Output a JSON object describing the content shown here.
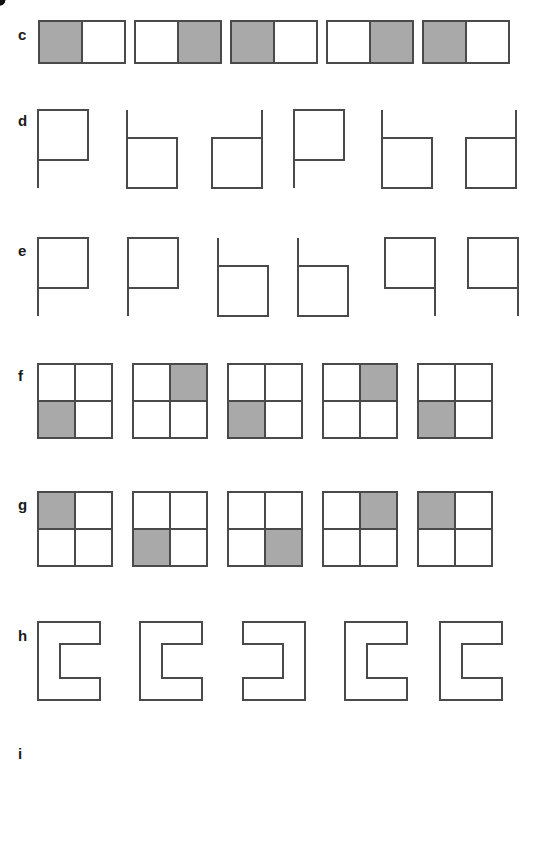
{
  "figure": {
    "type": "line-drawing-stimulus-sheet",
    "background_color": "#ffffff",
    "stroke_color": "#4a4a4a",
    "fill_gray": "#a9a9a9",
    "dot_color": "#111111",
    "rows": [
      {
        "label": "c",
        "label_x": 18,
        "label_y": 27,
        "kind": "domino",
        "description": "five 1x2 horizontal rectangles, one half shaded gray",
        "cell_w": 44,
        "cell_h": 44,
        "y": 20,
        "items": [
          {
            "x": 38,
            "shaded": "left"
          },
          {
            "x": 134,
            "shaded": "right"
          },
          {
            "x": 230,
            "shaded": "left"
          },
          {
            "x": 326,
            "shaded": "right"
          },
          {
            "x": 422,
            "shaded": "left"
          }
        ]
      },
      {
        "label": "d",
        "label_x": 18,
        "label_y": 113,
        "kind": "stem-square",
        "description": "six P/b/d letter-like figures: vertical stem plus square",
        "square": 50,
        "stem": 78,
        "y": 110,
        "items": [
          {
            "x": 38,
            "form": "P"
          },
          {
            "x": 127,
            "form": "b"
          },
          {
            "x": 212,
            "form": "d"
          },
          {
            "x": 294,
            "form": "P"
          },
          {
            "x": 382,
            "form": "b"
          },
          {
            "x": 466,
            "form": "d"
          }
        ]
      },
      {
        "label": "e",
        "label_x": 18,
        "label_y": 243,
        "kind": "stem-square",
        "description": "six P/P/b/b/q/q letter-like figures",
        "square": 50,
        "stem": 78,
        "y": 238,
        "items": [
          {
            "x": 38,
            "form": "P"
          },
          {
            "x": 128,
            "form": "P"
          },
          {
            "x": 218,
            "form": "b"
          },
          {
            "x": 298,
            "form": "b"
          },
          {
            "x": 385,
            "form": "q"
          },
          {
            "x": 468,
            "form": "q"
          }
        ]
      },
      {
        "label": "f",
        "label_x": 18,
        "label_y": 368,
        "kind": "quad",
        "description": "five 2x2 grids, one quadrant shaded",
        "cell": 37,
        "y": 364,
        "items": [
          {
            "x": 38,
            "shaded": "bottom-left"
          },
          {
            "x": 133,
            "shaded": "top-right"
          },
          {
            "x": 228,
            "shaded": "bottom-left"
          },
          {
            "x": 323,
            "shaded": "top-right"
          },
          {
            "x": 418,
            "shaded": "bottom-left"
          }
        ]
      },
      {
        "label": "g",
        "label_x": 18,
        "label_y": 497,
        "kind": "quad",
        "description": "five 2x2 grids, one quadrant shaded",
        "cell": 37,
        "y": 492,
        "items": [
          {
            "x": 38,
            "shaded": "top-left"
          },
          {
            "x": 133,
            "shaded": "bottom-left"
          },
          {
            "x": 228,
            "shaded": "bottom-right"
          },
          {
            "x": 323,
            "shaded": "top-right"
          },
          {
            "x": 418,
            "shaded": "top-left"
          }
        ]
      },
      {
        "label": "h",
        "label_x": 18,
        "label_y": 628,
        "kind": "c-shape",
        "description": "five bracket/C shapes, opening left or right",
        "w": 62,
        "h": 78,
        "arm": 22,
        "y": 622,
        "items": [
          {
            "x": 38,
            "opening": "right"
          },
          {
            "x": 140,
            "opening": "right"
          },
          {
            "x": 243,
            "opening": "left"
          },
          {
            "x": 345,
            "opening": "right"
          },
          {
            "x": 440,
            "opening": "right"
          }
        ]
      },
      {
        "label": "i",
        "label_x": 18,
        "label_y": 746,
        "kind": "maze",
        "description": "five pinwheel/maze line figures with one endpoint dot",
        "size": 86,
        "y": 740,
        "items": [
          {
            "x": 38,
            "variant": "base",
            "dot": "top-right"
          },
          {
            "x": 138,
            "variant": "rot180",
            "dot": "bottom-right"
          },
          {
            "x": 238,
            "variant": "mirror",
            "dot": "bottom-left"
          },
          {
            "x": 334,
            "variant": "mirror180",
            "dot": "top-left"
          },
          {
            "x": 434,
            "variant": "base",
            "dot": "top-right"
          }
        ]
      }
    ]
  }
}
